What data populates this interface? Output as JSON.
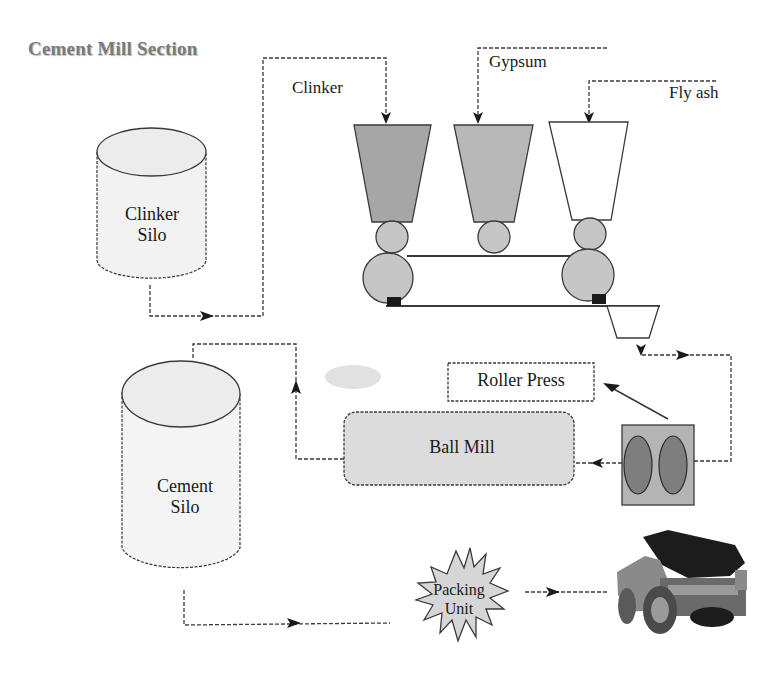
{
  "title": "Cement Mill Section",
  "inputs": {
    "clinker": "Clinker",
    "gypsum": "Gypsum",
    "fly_ash": "Fly ash"
  },
  "nodes": {
    "clinker_silo": {
      "line1": "Clinker",
      "line2": "Silo"
    },
    "cement_silo": {
      "line1": "Cement",
      "line2": "Silo"
    },
    "roller_press": "Roller Press",
    "ball_mill": "Ball Mill",
    "packing_unit": {
      "line1": "Packing",
      "line2": "Unit"
    },
    "truck": "dump-truck"
  },
  "colors": {
    "line": "#3a3a3a",
    "hopper_dark": "#a8a8a8",
    "hopper_mid": "#b8b8b8",
    "roller": "#c4c4c4",
    "ball_mill_fill": "#dcdcdc",
    "press_fill": "#b0b0b0",
    "press_roll": "#808080",
    "silo_fill": "#f2f2f2",
    "title": "#7a7a7a"
  }
}
